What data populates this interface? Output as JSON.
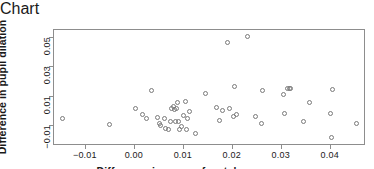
{
  "chart_data": {
    "type": "scatter",
    "title": "",
    "xlabel": "Difference in mean of match scores",
    "ylabel": "Difference in pupil dilation",
    "xlim": [
      -0.0165,
      0.0472
    ],
    "ylim": [
      -0.0235,
      0.0555
    ],
    "grid": false,
    "legend": null,
    "xticks": [
      -0.01,
      0.0,
      0.01,
      0.02,
      0.03,
      0.04
    ],
    "xtick_labels": [
      "-0.01",
      "0.00",
      "0.01",
      "0.02",
      "0.03",
      "0.04"
    ],
    "yticks": [
      -0.01,
      0.01,
      0.03,
      0.05
    ],
    "ytick_labels": [
      "-0.01",
      "0.01",
      "0.03",
      "0.05"
    ],
    "marker": "open-circle",
    "marker_color": "#7a7a7a",
    "points": [
      {
        "x": -0.0148,
        "y": -0.0046
      },
      {
        "x": -0.0052,
        "y": -0.0088
      },
      {
        "x": 0.0001,
        "y": 0.0022
      },
      {
        "x": 0.0016,
        "y": -0.0018
      },
      {
        "x": 0.0024,
        "y": -0.005
      },
      {
        "x": 0.0034,
        "y": 0.014
      },
      {
        "x": 0.0046,
        "y": -0.0038
      },
      {
        "x": 0.005,
        "y": -0.0079
      },
      {
        "x": 0.0053,
        "y": -0.0094
      },
      {
        "x": 0.006,
        "y": -0.005
      },
      {
        "x": 0.0062,
        "y": -0.0115
      },
      {
        "x": 0.0068,
        "y": -0.0121
      },
      {
        "x": 0.0072,
        "y": -0.007
      },
      {
        "x": 0.0074,
        "y": 0.0021
      },
      {
        "x": 0.0078,
        "y": 0.0032
      },
      {
        "x": 0.008,
        "y": 0.0014
      },
      {
        "x": 0.0083,
        "y": -0.0069
      },
      {
        "x": 0.0086,
        "y": 0.0018
      },
      {
        "x": 0.0088,
        "y": 0.006
      },
      {
        "x": 0.009,
        "y": -0.0068
      },
      {
        "x": 0.0092,
        "y": -0.012
      },
      {
        "x": 0.0096,
        "y": -0.0104
      },
      {
        "x": 0.01,
        "y": -0.0027
      },
      {
        "x": 0.0103,
        "y": 0.007
      },
      {
        "x": 0.0106,
        "y": -0.012
      },
      {
        "x": 0.0108,
        "y": -0.0048
      },
      {
        "x": 0.0112,
        "y": 0.0002
      },
      {
        "x": 0.0124,
        "y": -0.0152
      },
      {
        "x": 0.0144,
        "y": 0.0122
      },
      {
        "x": 0.0166,
        "y": 0.0029
      },
      {
        "x": 0.0172,
        "y": -0.0062
      },
      {
        "x": 0.0178,
        "y": 0.001
      },
      {
        "x": 0.019,
        "y": 0.047
      },
      {
        "x": 0.0194,
        "y": 0.0022
      },
      {
        "x": 0.0202,
        "y": -0.0037
      },
      {
        "x": 0.0204,
        "y": 0.0173
      },
      {
        "x": 0.0208,
        "y": -0.0018
      },
      {
        "x": 0.023,
        "y": 0.0508
      },
      {
        "x": 0.0246,
        "y": -0.0032
      },
      {
        "x": 0.0258,
        "y": -0.0079
      },
      {
        "x": 0.026,
        "y": 0.014
      },
      {
        "x": 0.0304,
        "y": 0.0117
      },
      {
        "x": 0.0306,
        "y": -0.0015
      },
      {
        "x": 0.0312,
        "y": 0.0157
      },
      {
        "x": 0.0316,
        "y": 0.0159
      },
      {
        "x": 0.0318,
        "y": 0.0154
      },
      {
        "x": 0.0344,
        "y": -0.0068
      },
      {
        "x": 0.0356,
        "y": 0.006
      },
      {
        "x": 0.04,
        "y": -0.0011
      },
      {
        "x": 0.0402,
        "y": -0.0178
      },
      {
        "x": 0.0404,
        "y": 0.015
      },
      {
        "x": 0.0452,
        "y": -0.0083
      }
    ]
  }
}
